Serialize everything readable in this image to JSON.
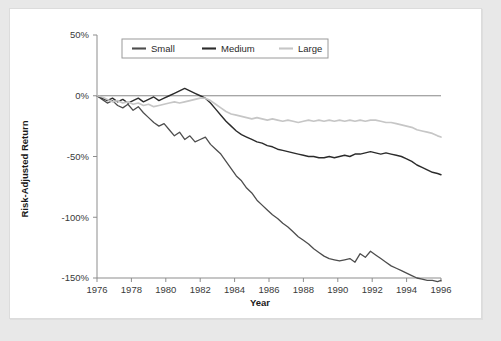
{
  "figure": {
    "background_color": "#ffffff",
    "page_background_color": "#e8e8e8",
    "axis_color": "#8d8d8d"
  },
  "chart_data": {
    "type": "line",
    "title": "",
    "subtitle": "",
    "xlabel": "Year",
    "ylabel": "Risk-Adjusted Return",
    "xlim": [
      1976,
      1996
    ],
    "ylim": [
      -150,
      50
    ],
    "xticks": [
      1976,
      1978,
      1980,
      1982,
      1984,
      1986,
      1988,
      1990,
      1992,
      1994,
      1996
    ],
    "xtick_labels": [
      "1976",
      "1978",
      "1980",
      "1982",
      "1984",
      "1986",
      "1988",
      "1990",
      "1992",
      "1994",
      "1996"
    ],
    "yticks": [
      50,
      0,
      -50,
      -100,
      -150
    ],
    "ytick_labels": [
      "50%",
      "0%",
      "-50%",
      "-100%",
      "-150%"
    ],
    "grid": false,
    "legend_position": "top-center",
    "zero_reference_line": true,
    "series": [
      {
        "name": "Small",
        "color": "#4d4d4d",
        "width": 1.3,
        "x": [
          1976.0,
          1976.3,
          1976.6,
          1976.9,
          1977.2,
          1977.5,
          1977.8,
          1978.1,
          1978.4,
          1978.7,
          1979.0,
          1979.3,
          1979.6,
          1979.9,
          1980.2,
          1980.5,
          1980.8,
          1981.1,
          1981.4,
          1981.7,
          1982.0,
          1982.3,
          1982.6,
          1982.9,
          1983.2,
          1983.5,
          1983.8,
          1984.1,
          1984.4,
          1984.7,
          1985.0,
          1985.3,
          1985.6,
          1985.9,
          1986.2,
          1986.5,
          1986.8,
          1987.1,
          1987.4,
          1987.7,
          1988.0,
          1988.3,
          1988.6,
          1988.9,
          1989.2,
          1989.5,
          1989.8,
          1990.1,
          1990.4,
          1990.7,
          1991.0,
          1991.3,
          1991.6,
          1991.9,
          1992.2,
          1992.5,
          1992.8,
          1993.1,
          1993.4,
          1993.7,
          1994.0,
          1994.3,
          1994.6,
          1994.9,
          1995.2,
          1995.5,
          1995.8,
          1996.0
        ],
        "y": [
          0,
          -3,
          -6,
          -4,
          -8,
          -10,
          -7,
          -12,
          -9,
          -14,
          -18,
          -22,
          -25,
          -23,
          -28,
          -33,
          -30,
          -36,
          -33,
          -38,
          -36,
          -34,
          -40,
          -44,
          -48,
          -54,
          -60,
          -66,
          -70,
          -76,
          -80,
          -86,
          -90,
          -94,
          -98,
          -101,
          -105,
          -108,
          -112,
          -116,
          -119,
          -122,
          -126,
          -129,
          -132,
          -134,
          -135,
          -136,
          -135,
          -134,
          -137,
          -130,
          -133,
          -128,
          -131,
          -134,
          -137,
          -140,
          -142,
          -144,
          -146,
          -148,
          -150,
          -151,
          -152,
          -152,
          -153,
          -152
        ]
      },
      {
        "name": "Medium",
        "color": "#2b2b2b",
        "width": 1.4,
        "x": [
          1976.0,
          1976.3,
          1976.6,
          1976.9,
          1977.2,
          1977.5,
          1977.8,
          1978.1,
          1978.4,
          1978.7,
          1979.0,
          1979.3,
          1979.6,
          1979.9,
          1980.2,
          1980.5,
          1980.8,
          1981.1,
          1981.4,
          1981.7,
          1982.0,
          1982.3,
          1982.6,
          1982.9,
          1983.2,
          1983.5,
          1983.8,
          1984.1,
          1984.4,
          1984.7,
          1985.0,
          1985.3,
          1985.6,
          1985.9,
          1986.2,
          1986.5,
          1986.8,
          1987.1,
          1987.4,
          1987.7,
          1988.0,
          1988.3,
          1988.6,
          1988.9,
          1989.2,
          1989.5,
          1989.8,
          1990.1,
          1990.4,
          1990.7,
          1991.0,
          1991.3,
          1991.6,
          1991.9,
          1992.2,
          1992.5,
          1992.8,
          1993.1,
          1993.4,
          1993.7,
          1994.0,
          1994.3,
          1994.6,
          1994.9,
          1995.2,
          1995.5,
          1995.8,
          1996.0
        ],
        "y": [
          0,
          -2,
          -4,
          -2,
          -5,
          -3,
          -6,
          -4,
          -2,
          -5,
          -3,
          -1,
          -4,
          -2,
          0,
          2,
          4,
          6,
          4,
          2,
          0,
          -2,
          -6,
          -11,
          -16,
          -21,
          -25,
          -29,
          -32,
          -34,
          -36,
          -38,
          -39,
          -41,
          -42,
          -44,
          -45,
          -46,
          -47,
          -48,
          -49,
          -50,
          -50,
          -51,
          -51,
          -50,
          -51,
          -50,
          -49,
          -50,
          -48,
          -48,
          -47,
          -46,
          -47,
          -48,
          -47,
          -48,
          -49,
          -50,
          -52,
          -54,
          -57,
          -59,
          -61,
          -63,
          -64,
          -65
        ]
      },
      {
        "name": "Large",
        "color": "#c6c6c6",
        "width": 1.7,
        "x": [
          1976.0,
          1976.3,
          1976.6,
          1976.9,
          1977.2,
          1977.5,
          1977.8,
          1978.1,
          1978.4,
          1978.7,
          1979.0,
          1979.3,
          1979.6,
          1979.9,
          1980.2,
          1980.5,
          1980.8,
          1981.1,
          1981.4,
          1981.7,
          1982.0,
          1982.3,
          1982.6,
          1982.9,
          1983.2,
          1983.5,
          1983.8,
          1984.1,
          1984.4,
          1984.7,
          1985.0,
          1985.3,
          1985.6,
          1985.9,
          1986.2,
          1986.5,
          1986.8,
          1987.1,
          1987.4,
          1987.7,
          1988.0,
          1988.3,
          1988.6,
          1988.9,
          1989.2,
          1989.5,
          1989.8,
          1990.1,
          1990.4,
          1990.7,
          1991.0,
          1991.3,
          1991.6,
          1991.9,
          1992.2,
          1992.5,
          1992.8,
          1993.1,
          1993.4,
          1993.7,
          1994.0,
          1994.3,
          1994.6,
          1994.9,
          1995.2,
          1995.5,
          1995.8,
          1996.0
        ],
        "y": [
          0,
          -1,
          -3,
          -5,
          -4,
          -6,
          -5,
          -7,
          -6,
          -8,
          -7,
          -9,
          -8,
          -7,
          -6,
          -5,
          -6,
          -5,
          -4,
          -3,
          -2,
          -2,
          -4,
          -7,
          -10,
          -13,
          -15,
          -16,
          -17,
          -18,
          -19,
          -18,
          -19,
          -20,
          -19,
          -20,
          -21,
          -20,
          -21,
          -22,
          -21,
          -20,
          -21,
          -20,
          -21,
          -20,
          -21,
          -20,
          -21,
          -20,
          -21,
          -20,
          -21,
          -20,
          -20,
          -21,
          -22,
          -22,
          -23,
          -24,
          -25,
          -26,
          -28,
          -29,
          -30,
          -31,
          -33,
          -34
        ]
      }
    ]
  },
  "legend": {
    "entries": [
      {
        "label": "Small",
        "color": "#4d4d4d"
      },
      {
        "label": "Medium",
        "color": "#2b2b2b"
      },
      {
        "label": "Large",
        "color": "#c6c6c6"
      }
    ]
  }
}
